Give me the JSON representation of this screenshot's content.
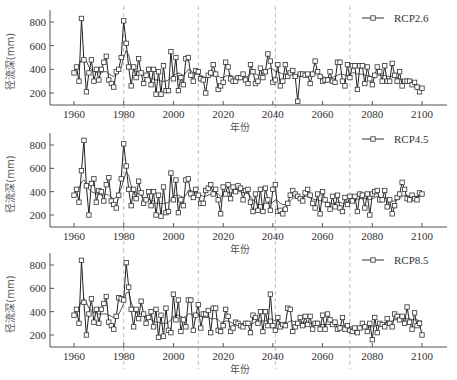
{
  "chart_data": [
    {
      "type": "line",
      "panel": "top",
      "legend": "RCP2.6",
      "xlabel": "年份",
      "ylabel": "径流深(mm)",
      "xticks": [
        1960,
        1980,
        2000,
        2020,
        2040,
        2060,
        2080,
        2100
      ],
      "yticks": [
        200,
        400,
        600,
        800
      ],
      "xlim": [
        1950,
        2110
      ],
      "ylim": [
        150,
        900
      ],
      "grid": false,
      "change_points": [
        1980,
        2010,
        2041,
        2071
      ],
      "x_start": 1960,
      "series": [
        {
          "name": "annual",
          "marker": "square",
          "values": [
            370,
            420,
            300,
            830,
            480,
            210,
            370,
            480,
            300,
            400,
            310,
            400,
            460,
            510,
            310,
            280,
            250,
            380,
            400,
            500,
            810,
            620,
            420,
            260,
            420,
            330,
            490,
            370,
            280,
            350,
            400,
            270,
            400,
            190,
            380,
            190,
            430,
            220,
            220,
            550,
            320,
            500,
            220,
            330,
            270,
            490,
            500,
            350,
            300,
            390,
            380,
            320,
            310,
            200,
            350,
            370,
            440,
            360,
            230,
            260,
            290,
            460,
            420,
            320,
            300,
            300,
            330,
            330,
            360,
            310,
            280,
            440,
            380,
            280,
            300,
            410,
            330,
            380,
            530,
            470,
            290,
            310,
            440,
            260,
            300,
            440,
            340,
            370,
            390,
            340,
            130,
            360,
            360,
            350,
            360,
            280,
            360,
            470,
            380,
            340,
            300,
            310,
            310,
            380,
            300,
            290,
            460,
            460,
            300,
            260,
            440,
            330,
            430,
            430,
            230,
            430,
            430,
            280,
            420,
            320,
            270,
            350,
            420,
            380,
            300,
            430,
            300,
            300,
            450,
            350,
            300,
            380,
            260,
            300,
            300,
            300,
            270,
            290,
            250,
            210,
            240
          ]
        },
        {
          "name": "moving_average",
          "marker": "none",
          "values": [
            380,
            400,
            440,
            480,
            490,
            470,
            420,
            400,
            380,
            380,
            370,
            370,
            380,
            380,
            360,
            350,
            340,
            360,
            380,
            420,
            500,
            560,
            520,
            430,
            400,
            380,
            380,
            360,
            350,
            340,
            340,
            320,
            320,
            310,
            310,
            300,
            300,
            300,
            310,
            330,
            350,
            360,
            370,
            360,
            350,
            370,
            400,
            390,
            370,
            360,
            360,
            350,
            340,
            330,
            330,
            340,
            350,
            350,
            340,
            330,
            330,
            340,
            350,
            350,
            340,
            330,
            330,
            340,
            350,
            340,
            340,
            360,
            370,
            360,
            350,
            360,
            370,
            380,
            400,
            410,
            400,
            380,
            380,
            370,
            360,
            360,
            360,
            360,
            360,
            350,
            340,
            340,
            340,
            340,
            350,
            350,
            360,
            370,
            370,
            360,
            340,
            330,
            330,
            330,
            330,
            340,
            350,
            360,
            360,
            350,
            350,
            360,
            370,
            370,
            360,
            360,
            360,
            350,
            350,
            340,
            340,
            350,
            350,
            350,
            350,
            350,
            340,
            340,
            340,
            340,
            330,
            320,
            310,
            300,
            300,
            300,
            290,
            280,
            270,
            260,
            250
          ]
        }
      ]
    },
    {
      "type": "line",
      "panel": "middle",
      "legend": "RCP4.5",
      "xlabel": "年份",
      "ylabel": "径流深(mm)",
      "xticks": [
        1960,
        1980,
        2000,
        2020,
        2040,
        2060,
        2080,
        2100
      ],
      "yticks": [
        200,
        400,
        600,
        800
      ],
      "xlim": [
        1950,
        2110
      ],
      "ylim": [
        150,
        900
      ],
      "grid": false,
      "change_points": [
        1980,
        2010,
        2041,
        2071
      ],
      "x_start": 1960,
      "series": [
        {
          "name": "annual",
          "marker": "square",
          "values": [
            370,
            420,
            310,
            580,
            840,
            450,
            200,
            470,
            510,
            310,
            410,
            400,
            320,
            460,
            520,
            320,
            290,
            260,
            370,
            510,
            810,
            620,
            420,
            280,
            420,
            340,
            490,
            390,
            300,
            330,
            400,
            280,
            400,
            200,
            370,
            190,
            440,
            220,
            230,
            560,
            330,
            500,
            220,
            330,
            280,
            500,
            510,
            380,
            350,
            420,
            370,
            300,
            300,
            410,
            430,
            460,
            380,
            420,
            330,
            210,
            440,
            380,
            460,
            340,
            440,
            400,
            450,
            430,
            330,
            410,
            420,
            310,
            230,
            380,
            240,
            420,
            230,
            430,
            330,
            240,
            420,
            460,
            230,
            240,
            210,
            250,
            300,
            370,
            410,
            380,
            360,
            340,
            320,
            390,
            420,
            370,
            300,
            260,
            380,
            210,
            400,
            330,
            290,
            250,
            360,
            270,
            370,
            260,
            230,
            350,
            290,
            360,
            320,
            360,
            230,
            380,
            370,
            260,
            380,
            200,
            380,
            400,
            410,
            330,
            330,
            410,
            270,
            330,
            210,
            280,
            350,
            380,
            480,
            420,
            340,
            330,
            370,
            340,
            330,
            390,
            380
          ]
        },
        {
          "name": "moving_average",
          "marker": "none",
          "values": [
            380,
            400,
            430,
            480,
            500,
            470,
            420,
            400,
            390,
            380,
            380,
            370,
            370,
            380,
            370,
            350,
            340,
            350,
            380,
            430,
            500,
            570,
            540,
            450,
            410,
            390,
            380,
            370,
            350,
            340,
            340,
            320,
            320,
            300,
            300,
            300,
            300,
            300,
            310,
            330,
            360,
            370,
            370,
            360,
            350,
            370,
            410,
            410,
            400,
            390,
            380,
            370,
            360,
            360,
            370,
            380,
            390,
            390,
            380,
            360,
            370,
            380,
            390,
            390,
            390,
            390,
            400,
            400,
            390,
            390,
            380,
            360,
            330,
            310,
            290,
            290,
            290,
            300,
            300,
            300,
            310,
            330,
            320,
            300,
            290,
            290,
            300,
            320,
            340,
            350,
            350,
            350,
            350,
            360,
            360,
            350,
            340,
            330,
            330,
            320,
            330,
            320,
            310,
            300,
            300,
            300,
            310,
            310,
            300,
            300,
            310,
            320,
            330,
            330,
            330,
            340,
            340,
            340,
            340,
            330,
            340,
            350,
            360,
            350,
            350,
            350,
            340,
            330,
            320,
            320,
            330,
            340,
            360,
            370,
            370,
            360,
            360,
            360,
            360,
            360,
            360
          ]
        }
      ]
    },
    {
      "type": "line",
      "panel": "bottom",
      "legend": "RCP8.5",
      "xlabel": "年份",
      "ylabel": "径流深(mm)",
      "xticks": [
        1960,
        1980,
        2000,
        2020,
        2040,
        2060,
        2080,
        2100
      ],
      "yticks": [
        200,
        400,
        600,
        800
      ],
      "xlim": [
        1950,
        2110
      ],
      "ylim": [
        150,
        900
      ],
      "grid": false,
      "change_points": [
        1980,
        2010,
        2041,
        2071
      ],
      "x_start": 1960,
      "series": [
        {
          "name": "annual",
          "marker": "square",
          "values": [
            370,
            420,
            300,
            840,
            480,
            200,
            380,
            510,
            310,
            420,
            300,
            420,
            470,
            530,
            310,
            280,
            250,
            360,
            520,
            510,
            500,
            820,
            610,
            420,
            270,
            420,
            340,
            490,
            380,
            300,
            350,
            400,
            270,
            420,
            180,
            370,
            190,
            430,
            240,
            220,
            550,
            330,
            500,
            230,
            330,
            270,
            500,
            500,
            240,
            370,
            460,
            260,
            380,
            380,
            410,
            220,
            430,
            430,
            240,
            230,
            280,
            420,
            360,
            230,
            260,
            310,
            300,
            280,
            270,
            300,
            300,
            220,
            370,
            350,
            300,
            400,
            230,
            400,
            280,
            550,
            280,
            240,
            350,
            270,
            290,
            280,
            430,
            420,
            230,
            270,
            300,
            350,
            280,
            360,
            290,
            360,
            250,
            300,
            300,
            250,
            370,
            250,
            380,
            330,
            290,
            310,
            250,
            260,
            350,
            250,
            280,
            240,
            230,
            260,
            220,
            260,
            300,
            270,
            230,
            300,
            160,
            350,
            220,
            300,
            290,
            270,
            340,
            300,
            270,
            380,
            360,
            330,
            360,
            300,
            440,
            310,
            250,
            390,
            280,
            300,
            200
          ]
        },
        {
          "name": "moving_average",
          "marker": "none",
          "values": [
            380,
            400,
            440,
            490,
            510,
            480,
            430,
            410,
            390,
            390,
            380,
            380,
            380,
            380,
            370,
            360,
            350,
            360,
            380,
            420,
            470,
            560,
            570,
            480,
            420,
            400,
            390,
            380,
            360,
            350,
            350,
            330,
            320,
            310,
            310,
            300,
            300,
            300,
            310,
            330,
            360,
            370,
            370,
            360,
            350,
            360,
            380,
            380,
            370,
            370,
            370,
            360,
            350,
            350,
            350,
            340,
            340,
            340,
            330,
            310,
            310,
            320,
            320,
            310,
            300,
            300,
            300,
            290,
            290,
            290,
            290,
            290,
            300,
            310,
            310,
            320,
            320,
            320,
            330,
            340,
            330,
            320,
            320,
            310,
            300,
            300,
            310,
            320,
            320,
            310,
            300,
            310,
            310,
            310,
            300,
            300,
            300,
            300,
            290,
            290,
            290,
            290,
            290,
            290,
            290,
            290,
            290,
            280,
            280,
            280,
            280,
            270,
            270,
            270,
            270,
            270,
            270,
            270,
            270,
            270,
            270,
            280,
            280,
            290,
            290,
            300,
            310,
            310,
            320,
            330,
            330,
            330,
            340,
            340,
            340,
            340,
            330,
            330,
            330,
            320,
            320
          ]
        }
      ]
    }
  ],
  "panels": [
    {
      "legend": "RCP2.6",
      "xlabel": "年份",
      "ylabel": "径流深(mm)"
    },
    {
      "legend": "RCP4.5",
      "xlabel": "年份",
      "ylabel": "径流深(mm)"
    },
    {
      "legend": "RCP8.5",
      "xlabel": "年份",
      "ylabel": "径流深(mm)"
    }
  ],
  "axis": {
    "xticks": [
      "1960",
      "1980",
      "2000",
      "2020",
      "2040",
      "2060",
      "2080",
      "2100"
    ],
    "yticks": [
      "200",
      "400",
      "600",
      "800"
    ]
  }
}
